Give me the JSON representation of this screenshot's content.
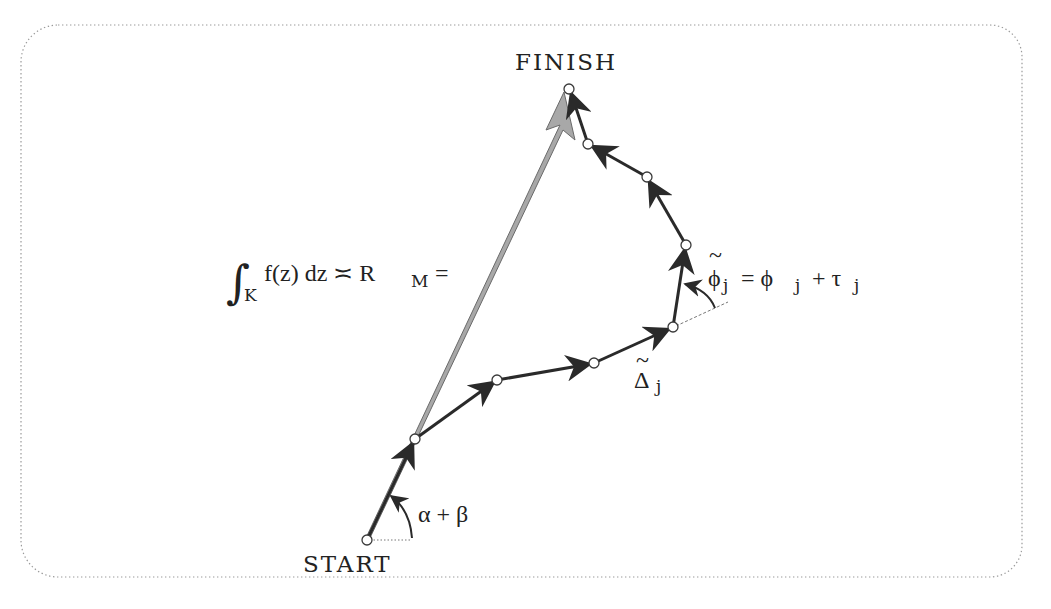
{
  "diagram": {
    "labels": {
      "finish": "FINISH",
      "start": "START",
      "integral_sign": "∫",
      "integral_lower": "K",
      "integral_body": "f(z) dz ≍ R",
      "integral_sub": "M",
      "integral_eq": "=",
      "angle_start": "α + β",
      "delta_tilde": "~",
      "delta": "Δ",
      "delta_sub": "j",
      "phi_tilde": "~",
      "phi_lhs": "ϕ",
      "phi_lhs_sub": "j",
      "phi_eq": "= ϕ",
      "phi_rhs_sub": "j",
      "phi_plus": "+ τ",
      "tau_sub": "j"
    },
    "colors": {
      "border": "#9a9a9a",
      "path_stroke": "#2a2a2a",
      "resultant_fill": "#a8a8a8",
      "resultant_stroke": "#6a6a6a",
      "node_fill": "#ffffff"
    },
    "nodes": [
      {
        "id": "start",
        "x": 367,
        "y": 540
      },
      {
        "id": "n1",
        "x": 415,
        "y": 439
      },
      {
        "id": "n2",
        "x": 497,
        "y": 380
      },
      {
        "id": "n3",
        "x": 594,
        "y": 363
      },
      {
        "id": "n4",
        "x": 673,
        "y": 327
      },
      {
        "id": "n5",
        "x": 686,
        "y": 245
      },
      {
        "id": "n6",
        "x": 647,
        "y": 177
      },
      {
        "id": "n7",
        "x": 588,
        "y": 144
      },
      {
        "id": "finish",
        "x": 569,
        "y": 89
      }
    ]
  }
}
